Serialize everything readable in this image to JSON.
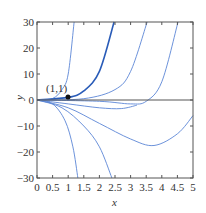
{
  "chart_data": {
    "type": "line",
    "title": "",
    "xlabel": "x",
    "ylabel": "y",
    "xlim": [
      0,
      5
    ],
    "ylim": [
      -30,
      30
    ],
    "grid": false,
    "xticks": [
      "0",
      "0.5",
      "1",
      "1.5",
      "2",
      "2.5",
      "3",
      "3.5",
      "4",
      "4.5",
      "5"
    ],
    "yticks": [
      "30",
      "20",
      "10",
      "0",
      "−10",
      "−20",
      "−30"
    ],
    "annotation": {
      "text": "(1,1)",
      "x": 1,
      "y": 1
    },
    "series": [
      {
        "name": "curve-1",
        "points": [
          [
            0,
            0
          ],
          [
            0.5,
            0.6
          ],
          [
            0.8,
            4
          ],
          [
            1.0,
            10
          ],
          [
            1.19,
            30
          ]
        ]
      },
      {
        "name": "curve-2 (through (1,1))",
        "points": [
          [
            0,
            0
          ],
          [
            1,
            1
          ],
          [
            1.5,
            3.5
          ],
          [
            2,
            11
          ],
          [
            2.47,
            30
          ]
        ],
        "emphasis": true
      },
      {
        "name": "curve-3",
        "points": [
          [
            0,
            0
          ],
          [
            1.5,
            0.5
          ],
          [
            2.5,
            4
          ],
          [
            3,
            11
          ],
          [
            3.53,
            30
          ]
        ]
      },
      {
        "name": "curve-4",
        "points": [
          [
            0,
            0
          ],
          [
            2,
            -0.5
          ],
          [
            3,
            -1.5
          ],
          [
            3.5,
            -0.5
          ],
          [
            4,
            7
          ],
          [
            4.52,
            30
          ]
        ]
      },
      {
        "name": "curve-5",
        "points": [
          [
            0,
            0
          ],
          [
            1,
            -1.5
          ],
          [
            2,
            -3
          ],
          [
            2.7,
            -3.3
          ],
          [
            3.2,
            -2
          ]
        ]
      },
      {
        "name": "curve-6",
        "points": [
          [
            0,
            0
          ],
          [
            1,
            -3
          ],
          [
            2,
            -9
          ],
          [
            3,
            -15
          ],
          [
            3.75,
            -17.5
          ],
          [
            4.5,
            -13
          ],
          [
            5,
            -6
          ]
        ]
      },
      {
        "name": "curve-7",
        "points": [
          [
            0,
            0
          ],
          [
            0.8,
            -3
          ],
          [
            1.5,
            -10
          ],
          [
            2,
            -18
          ],
          [
            2.4,
            -30
          ]
        ]
      },
      {
        "name": "curve-8",
        "points": [
          [
            0,
            0
          ],
          [
            0.5,
            -1.5
          ],
          [
            0.9,
            -8
          ],
          [
            1.15,
            -18
          ],
          [
            1.31,
            -30
          ]
        ]
      }
    ]
  }
}
